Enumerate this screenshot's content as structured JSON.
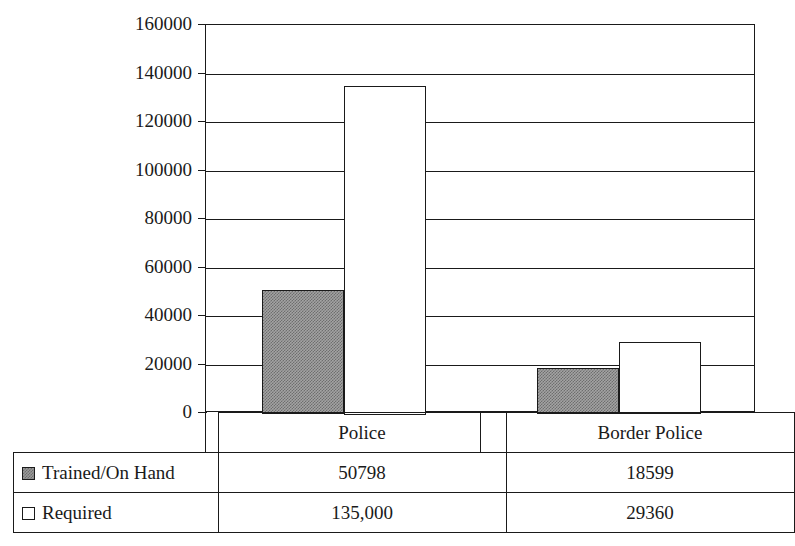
{
  "chart_data": {
    "type": "bar",
    "title": "",
    "xlabel": "",
    "ylabel": "",
    "categories": [
      "Police",
      "Border Police"
    ],
    "series": [
      {
        "name": "Trained/On Hand",
        "values": [
          50798,
          18599
        ],
        "swatch": "filled-gray-square",
        "display_values": [
          "50798",
          "18599"
        ]
      },
      {
        "name": "Required",
        "values": [
          135000,
          29360
        ],
        "swatch": "hollow-white-square",
        "display_values": [
          "135,000",
          "29360"
        ]
      }
    ],
    "ylim": [
      0,
      160000
    ],
    "ytick_values": [
      0,
      20000,
      40000,
      60000,
      80000,
      100000,
      120000,
      140000,
      160000
    ],
    "ytick_labels": [
      "0",
      "20000",
      "40000",
      "60000",
      "80000",
      "100000",
      "120000",
      "140000",
      "160000"
    ],
    "grid": true,
    "legend_position": "bottom-table",
    "colors": {
      "axis": "#1a1a1a",
      "grid": "#1a1a1a",
      "series_trained": "#9a9a9a",
      "series_required": "#ffffff",
      "background": "#ffffff"
    }
  },
  "data_table": {
    "header_row": [
      "",
      "Police",
      "Border Police"
    ],
    "rows": [
      {
        "label": "Trained/On Hand",
        "swatch": "filled",
        "cells": [
          "50798",
          "18599"
        ]
      },
      {
        "label": "Required",
        "swatch": "hollow",
        "cells": [
          "135,000",
          "29360"
        ]
      }
    ]
  },
  "axis": {
    "ticks": [
      {
        "label": "160000",
        "value": 160000
      },
      {
        "label": "140000",
        "value": 140000
      },
      {
        "label": "120000",
        "value": 120000
      },
      {
        "label": "100000",
        "value": 100000
      },
      {
        "label": "80000",
        "value": 80000
      },
      {
        "label": "60000",
        "value": 60000
      },
      {
        "label": "40000",
        "value": 40000
      },
      {
        "label": "20000",
        "value": 20000
      },
      {
        "label": "0",
        "value": 0
      }
    ]
  }
}
